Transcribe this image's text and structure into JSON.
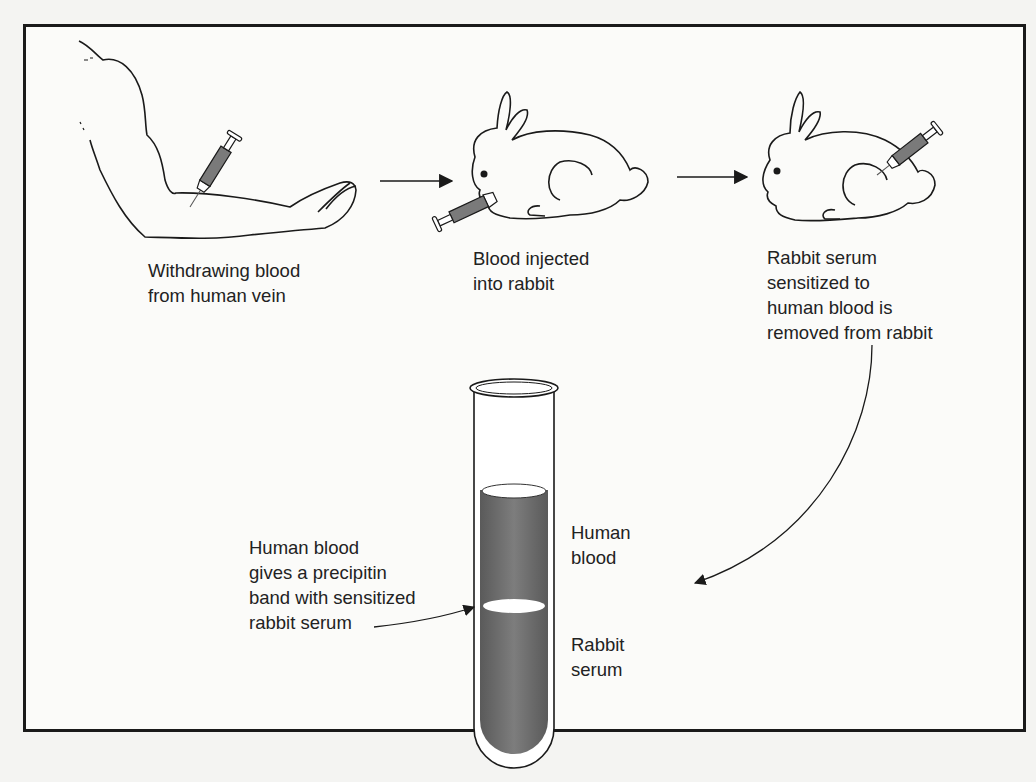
{
  "diagram": {
    "steps": [
      {
        "id": "step1",
        "label": "Withdrawing blood\nfrom human vein",
        "icon": "arm-with-syringe"
      },
      {
        "id": "step2",
        "label": "Blood injected\ninto rabbit",
        "icon": "rabbit-injected-mouth"
      },
      {
        "id": "step3",
        "label": "Rabbit serum\nsensitized to\nhuman blood is\nremoved from rabbit",
        "icon": "rabbit-syringe-back"
      }
    ],
    "test_tube": {
      "upper_layer_label": "Human\nblood",
      "lower_layer_label": "Rabbit\nserum",
      "band_label": "Human blood\ngives a precipitin\nband with sensitized\nrabbit serum"
    },
    "arrows": [
      {
        "from": "step1",
        "to": "step2"
      },
      {
        "from": "step2",
        "to": "step3"
      },
      {
        "from": "step3",
        "to": "test_tube"
      },
      {
        "from": "band_label",
        "to": "precipitin_band"
      }
    ],
    "colors": {
      "line": "#1a1a1a",
      "fluid": "#6e6e6e",
      "syringe_fill": "#7a7a7a",
      "background": "#fbfbf9",
      "text": "#222222"
    }
  }
}
